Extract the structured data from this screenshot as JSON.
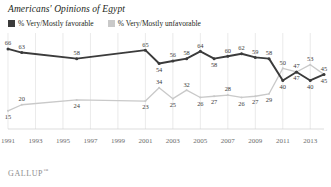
{
  "header": {
    "title": "Americans' Opinions of Egypt",
    "source": "GALLUP",
    "source_mark": "™"
  },
  "legend": {
    "position": "top-left",
    "items": [
      {
        "label": "% Very/Mostly favorable",
        "color": "#3b3b3b",
        "swatch": "legend-swatch-favorable"
      },
      {
        "label": "% Very/Mostly unfavorable",
        "color": "#c9c9c9",
        "swatch": "legend-swatch-unfavorable"
      }
    ]
  },
  "chart_data": {
    "type": "line",
    "title": "Americans' Opinions of Egypt",
    "xlabel": "",
    "ylabel": "",
    "ylim": [
      0,
      75
    ],
    "xlim": [
      1991,
      2014
    ],
    "grid": "vertical-only",
    "tick_labels": [
      "1991",
      "1993",
      "1995",
      "1997",
      "1999",
      "2001",
      "2003",
      "2005",
      "2007",
      "2009",
      "2011",
      "2013"
    ],
    "tick_years": [
      1991,
      1993,
      1995,
      1997,
      1999,
      2001,
      2003,
      2005,
      2007,
      2009,
      2011,
      2013
    ],
    "series": [
      {
        "name": "% Very/Mostly favorable",
        "color": "#3b3b3b",
        "x": [
          1991,
          1992,
          1996,
          2001,
          2002,
          2003,
          2004,
          2005,
          2006,
          2007,
          2008,
          2009,
          2010,
          2011,
          2012,
          2013,
          2014
        ],
        "values": [
          66,
          63,
          58,
          65,
          54,
          56,
          58,
          64,
          58,
          60,
          62,
          59,
          58,
          40,
          47,
          40,
          45
        ],
        "labels": [
          "66",
          "63",
          "58",
          "65",
          "54",
          "56",
          "58",
          "64",
          "58",
          "60",
          "62",
          "59",
          "58",
          "40",
          "47",
          "40",
          "45"
        ],
        "label_side": [
          "above",
          "above",
          "above",
          "above",
          "below",
          "above",
          "above",
          "above",
          "below",
          "above",
          "above",
          "above",
          "above",
          "below",
          "below",
          "below",
          "below"
        ]
      },
      {
        "name": "% Very/Mostly unfavorable",
        "color": "#c9c9c9",
        "x": [
          1991,
          1992,
          1996,
          2001,
          2002,
          2003,
          2004,
          2005,
          2006,
          2007,
          2008,
          2009,
          2010,
          2011,
          2012,
          2013,
          2014
        ],
        "values": [
          15,
          20,
          24,
          23,
          34,
          25,
          32,
          26,
          27,
          28,
          26,
          27,
          29,
          50,
          47,
          53,
          45
        ],
        "labels": [
          "15",
          "20",
          "24",
          "23",
          "34",
          "25",
          "32",
          "26",
          "27",
          "28",
          "26",
          "27",
          "29",
          "50",
          "47",
          "53",
          "45"
        ],
        "label_side": [
          "below",
          "above",
          "below",
          "below",
          "above",
          "below",
          "above",
          "below",
          "below",
          "above",
          "below",
          "below",
          "below",
          "above",
          "above",
          "above",
          "above"
        ]
      }
    ]
  }
}
